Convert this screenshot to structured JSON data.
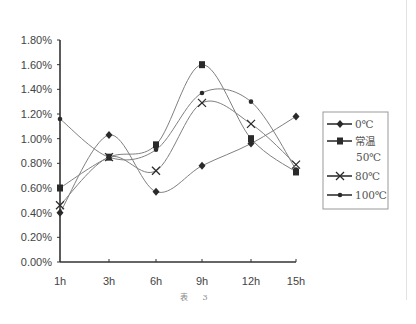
{
  "chart_data": {
    "type": "line",
    "title": "",
    "caption": "表 3",
    "xlabel": "",
    "ylabel": "",
    "categories": [
      "1h",
      "3h",
      "6h",
      "9h",
      "12h",
      "15h"
    ],
    "ylim": [
      0,
      1.8
    ],
    "y_ticks": [
      "0.00%",
      "0.20%",
      "0.40%",
      "0.60%",
      "0.80%",
      "1.00%",
      "1.20%",
      "1.40%",
      "1.60%",
      "1.80%"
    ],
    "grid": false,
    "smooth": true,
    "legend_position": "right",
    "series": [
      {
        "name": "0℃",
        "marker": "diamond",
        "values": [
          0.4,
          1.03,
          0.57,
          0.78,
          0.96,
          1.18
        ]
      },
      {
        "name": "常温50℃",
        "marker": "square",
        "values": [
          0.6,
          0.85,
          0.95,
          1.6,
          1.0,
          0.73
        ]
      },
      {
        "name": "80℃",
        "marker": "x",
        "values": [
          0.46,
          0.85,
          0.74,
          1.29,
          1.12,
          0.79
        ]
      },
      {
        "name": "100℃",
        "marker": "dot",
        "values": [
          1.16,
          0.85,
          0.91,
          1.37,
          1.3,
          0.75
        ]
      }
    ]
  },
  "legend": {
    "items": [
      {
        "label_line1": "0℃",
        "label_line2": ""
      },
      {
        "label_line1": "常温",
        "label_line2": "50℃"
      },
      {
        "label_line1": "80℃",
        "label_line2": ""
      },
      {
        "label_line1": "100℃",
        "label_line2": ""
      }
    ]
  },
  "colors": {
    "axis": "#333333",
    "line": "#808080",
    "marker": "#2a2a2a",
    "legend_border": "#999999"
  }
}
